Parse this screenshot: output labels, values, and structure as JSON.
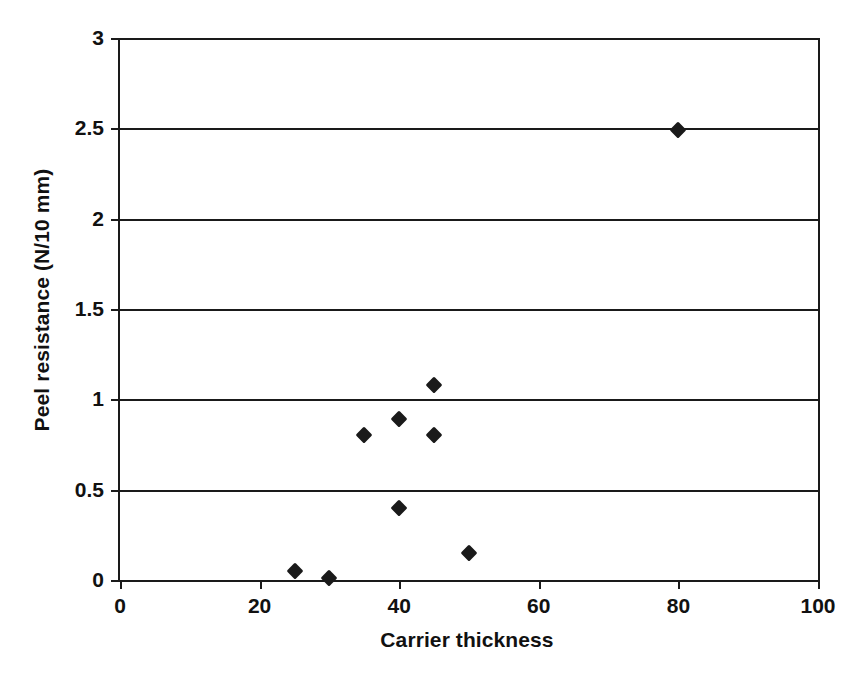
{
  "chart_data": {
    "type": "scatter",
    "title": "",
    "xlabel": "Carrier thickness",
    "ylabel": "Peel resistance (N/10 mm)",
    "xlim": [
      0,
      100
    ],
    "ylim": [
      0,
      3
    ],
    "xticks": [
      "0",
      "20",
      "40",
      "60",
      "80",
      "100"
    ],
    "yticks": [
      "0",
      "0.5",
      "1",
      "1.5",
      "2",
      "2.5",
      "3"
    ],
    "xtick_values": [
      0,
      20,
      40,
      60,
      80,
      100
    ],
    "ytick_values": [
      0,
      0.5,
      1,
      1.5,
      2,
      2.5,
      3
    ],
    "grid": "horizontal",
    "legend": "none",
    "marker": "filled-diamond",
    "marker_color": "#1a1a1a",
    "series": [
      {
        "name": "Peel resistance vs carrier thickness",
        "points": [
          {
            "x": 25,
            "y": 0.05
          },
          {
            "x": 30,
            "y": 0.01
          },
          {
            "x": 35,
            "y": 0.8
          },
          {
            "x": 40,
            "y": 0.4
          },
          {
            "x": 40,
            "y": 0.89
          },
          {
            "x": 45,
            "y": 1.08
          },
          {
            "x": 45,
            "y": 0.8
          },
          {
            "x": 50,
            "y": 0.15
          },
          {
            "x": 80,
            "y": 2.49
          }
        ]
      }
    ]
  }
}
